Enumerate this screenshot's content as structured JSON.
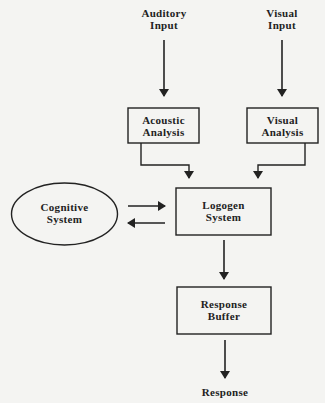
{
  "diagram": {
    "nodes": {
      "auditory_input": {
        "line1": "Auditory",
        "line2": "Input"
      },
      "visual_input": {
        "line1": "Visual",
        "line2": "Input"
      },
      "acoustic_analysis": {
        "line1": "Acoustic",
        "line2": "Analysis"
      },
      "visual_analysis": {
        "line1": "Visual",
        "line2": "Analysis"
      },
      "cognitive_system": {
        "line1": "Cognitive",
        "line2": "System"
      },
      "logogen_system": {
        "line1": "Logogen",
        "line2": "System"
      },
      "response_buffer": {
        "line1": "Response",
        "line2": "Buffer"
      },
      "response": {
        "line1": "Response"
      }
    },
    "edges": [
      {
        "from": "Auditory Input",
        "to": "Acoustic Analysis"
      },
      {
        "from": "Visual Input",
        "to": "Visual Analysis"
      },
      {
        "from": "Acoustic Analysis",
        "to": "Logogen System"
      },
      {
        "from": "Visual Analysis",
        "to": "Logogen System"
      },
      {
        "from": "Cognitive System",
        "to": "Logogen System"
      },
      {
        "from": "Logogen System",
        "to": "Cognitive System"
      },
      {
        "from": "Logogen System",
        "to": "Response Buffer"
      },
      {
        "from": "Response Buffer",
        "to": "Response"
      }
    ],
    "colors": {
      "stroke": "#222222",
      "background": "#f4f4f2"
    }
  }
}
